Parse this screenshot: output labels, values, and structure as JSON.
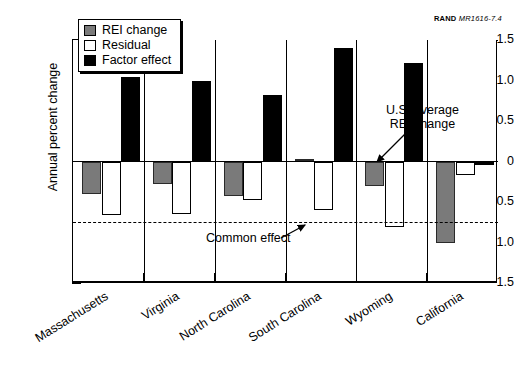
{
  "credit": {
    "org": "RAND",
    "id": "MR1616-7.4"
  },
  "axes": {
    "ylabel": "Annual percent change",
    "yticks": [
      "1.5",
      "1.0",
      "0.5",
      "0",
      "−0.5",
      "−1.0",
      "−1.5"
    ],
    "ytick_values": [
      1.5,
      1.0,
      0.5,
      0,
      -0.5,
      -1.0,
      -1.5
    ],
    "ymin": -1.5,
    "ymax": 1.5
  },
  "legend": {
    "items": [
      {
        "label": "REI change",
        "key": "rei",
        "color": "#7a7a7a"
      },
      {
        "label": "Residual",
        "key": "res",
        "color": "#ffffff"
      },
      {
        "label": "Factor effect",
        "key": "fac",
        "color": "#000000"
      }
    ]
  },
  "annotations": [
    {
      "name": "us-average-annotation",
      "line1": "U.S. average",
      "line2": "REI change"
    },
    {
      "name": "common-effect-annotation",
      "line1": "Common effect",
      "line2": ""
    }
  ],
  "common_effect": {
    "label": "Common effect",
    "value": -0.75
  },
  "chart_data": {
    "type": "bar",
    "title": "",
    "xlabel": "",
    "ylabel": "Annual percent change",
    "ylim": [
      -1.5,
      1.5
    ],
    "grid": false,
    "legend_position": "top-left",
    "categories": [
      "Massachusetts",
      "Virginia",
      "North Carolina",
      "South Carolina",
      "Wyoming",
      "California"
    ],
    "series": [
      {
        "name": "REI change",
        "values": [
          -0.4,
          -0.28,
          -0.42,
          0.03,
          -0.3,
          -1.0
        ]
      },
      {
        "name": "Residual",
        "values": [
          -0.66,
          -0.65,
          -0.48,
          -0.6,
          -0.81,
          -0.17
        ]
      },
      {
        "name": "Factor effect",
        "values": [
          1.04,
          1.0,
          0.82,
          1.4,
          1.22,
          -0.04
        ]
      }
    ],
    "reference_lines": [
      {
        "label": "Common effect",
        "value": -0.75,
        "style": "dashed"
      },
      {
        "label": "U.S. average REI change",
        "value": 0.0,
        "style": "solid"
      }
    ]
  }
}
